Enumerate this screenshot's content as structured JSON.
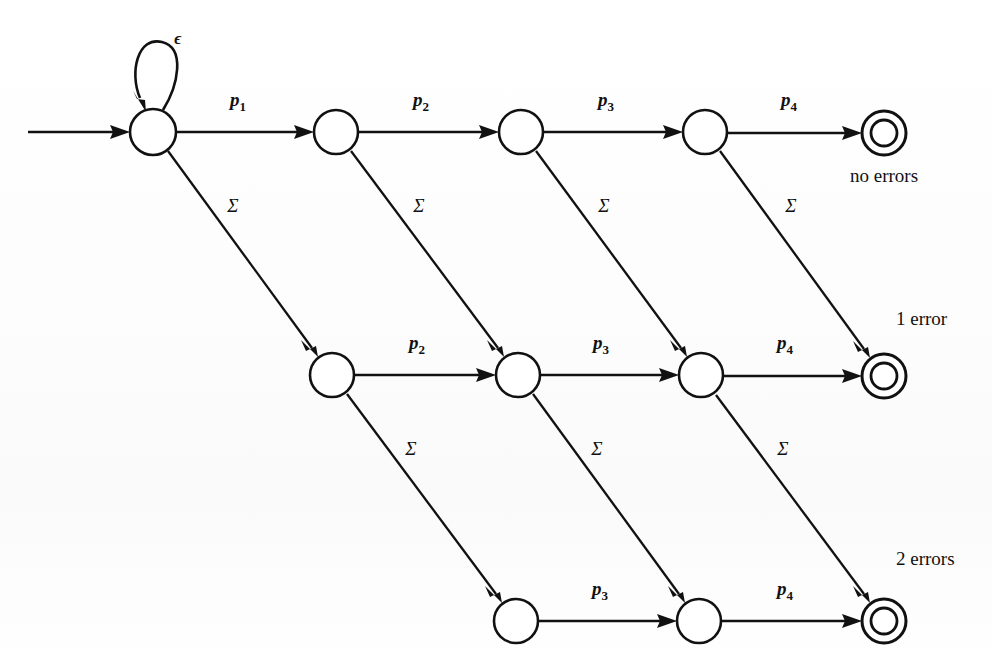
{
  "diagram": {
    "type": "state-transition-diagram",
    "background_color": "#fefefe",
    "stroke_color": "#111111",
    "start_arrow": {
      "label": "",
      "from_x": 28,
      "to_x": 126,
      "y": 132
    },
    "self_loop": {
      "label": "ϵ",
      "on_state": "r0c0",
      "label_x": 178,
      "label_y": 44
    },
    "rows": [
      {
        "id": "row-0",
        "error_count": 0,
        "caption": "no errors",
        "caption_x": 884,
        "caption_y": 182,
        "caption_position": "below",
        "y": 132,
        "states": [
          {
            "id": "r0c0",
            "cx": 153,
            "cy": 132,
            "r": 23,
            "kind": "start",
            "accepting": false
          },
          {
            "id": "r0c1",
            "cx": 336,
            "cy": 132,
            "r": 22,
            "kind": "normal",
            "accepting": false
          },
          {
            "id": "r0c2",
            "cx": 521,
            "cy": 132,
            "r": 22,
            "kind": "normal",
            "accepting": false
          },
          {
            "id": "r0c3",
            "cx": 705,
            "cy": 132,
            "r": 22,
            "kind": "normal",
            "accepting": false
          },
          {
            "id": "r0c4",
            "cx": 884,
            "cy": 133,
            "r": 22,
            "kind": "accept",
            "accepting": true
          }
        ],
        "horizontal_labels": [
          "p1",
          "p2",
          "p3",
          "p4"
        ]
      },
      {
        "id": "row-1",
        "error_count": 1,
        "caption": "1 error",
        "caption_x": 896,
        "caption_y": 325,
        "caption_position": "above-left",
        "y": 375,
        "states": [
          {
            "id": "r1c1",
            "cx": 332,
            "cy": 375,
            "r": 22,
            "kind": "normal",
            "accepting": false
          },
          {
            "id": "r1c2",
            "cx": 518,
            "cy": 375,
            "r": 22,
            "kind": "normal",
            "accepting": false
          },
          {
            "id": "r1c3",
            "cx": 701,
            "cy": 375,
            "r": 22,
            "kind": "normal",
            "accepting": false
          },
          {
            "id": "r1c4",
            "cx": 884,
            "cy": 376,
            "r": 22,
            "kind": "accept",
            "accepting": true
          }
        ],
        "horizontal_labels": [
          "p2",
          "p3",
          "p4"
        ]
      },
      {
        "id": "row-2",
        "error_count": 2,
        "caption": "2 errors",
        "caption_x": 896,
        "caption_y": 565,
        "caption_position": "above-left",
        "y": 621,
        "states": [
          {
            "id": "r2c2",
            "cx": 516,
            "cy": 621,
            "r": 22,
            "kind": "normal",
            "accepting": false
          },
          {
            "id": "r2c3",
            "cx": 699,
            "cy": 621,
            "r": 22,
            "kind": "normal",
            "accepting": false
          },
          {
            "id": "r2c4",
            "cx": 884,
            "cy": 621,
            "r": 22,
            "kind": "accept",
            "accepting": true
          }
        ],
        "horizontal_labels": [
          "p3",
          "p4"
        ]
      }
    ],
    "horizontal_edges": [
      {
        "id": "e-r0c0-r0c1",
        "from": "r0c0",
        "to": "r0c1",
        "label_base": "p",
        "label_sub": "1",
        "label_x": 238,
        "label_y": 106
      },
      {
        "id": "e-r0c1-r0c2",
        "from": "r0c1",
        "to": "r0c2",
        "label_base": "p",
        "label_sub": "2",
        "label_x": 421,
        "label_y": 106
      },
      {
        "id": "e-r0c2-r0c3",
        "from": "r0c2",
        "to": "r0c3",
        "label_base": "p",
        "label_sub": "3",
        "label_x": 606,
        "label_y": 106
      },
      {
        "id": "e-r0c3-r0c4",
        "from": "r0c3",
        "to": "r0c4",
        "label_base": "p",
        "label_sub": "4",
        "label_x": 789,
        "label_y": 106
      },
      {
        "id": "e-r1c1-r1c2",
        "from": "r1c1",
        "to": "r1c2",
        "label_base": "p",
        "label_sub": "2",
        "label_x": 417,
        "label_y": 349
      },
      {
        "id": "e-r1c2-r1c3",
        "from": "r1c2",
        "to": "r1c3",
        "label_base": "p",
        "label_sub": "3",
        "label_x": 601,
        "label_y": 349
      },
      {
        "id": "e-r1c3-r1c4",
        "from": "r1c3",
        "to": "r1c4",
        "label_base": "p",
        "label_sub": "4",
        "label_x": 785,
        "label_y": 349
      },
      {
        "id": "e-r2c2-r2c3",
        "from": "r2c2",
        "to": "r2c3",
        "label_base": "p",
        "label_sub": "3",
        "label_x": 600,
        "label_y": 595
      },
      {
        "id": "e-r2c3-r2c4",
        "from": "r2c3",
        "to": "r2c4",
        "label_base": "p",
        "label_sub": "4",
        "label_x": 785,
        "label_y": 595
      }
    ],
    "diagonal_edges": [
      {
        "id": "d-r0c0-r1c1",
        "from": "r0c0",
        "to": "r1c1",
        "label": "Σ",
        "label_x": 233,
        "label_y": 212
      },
      {
        "id": "d-r0c1-r1c2",
        "from": "r0c1",
        "to": "r1c2",
        "label": "Σ",
        "label_x": 419,
        "label_y": 212
      },
      {
        "id": "d-r0c2-r1c3",
        "from": "r0c2",
        "to": "r1c3",
        "label": "Σ",
        "label_x": 604,
        "label_y": 212
      },
      {
        "id": "d-r0c3-r1c4",
        "from": "r0c3",
        "to": "r1c4",
        "label": "Σ",
        "label_x": 791,
        "label_y": 212
      },
      {
        "id": "d-r1c1-r2c2",
        "from": "r1c1",
        "to": "r2c2",
        "label": "Σ",
        "label_x": 411,
        "label_y": 455
      },
      {
        "id": "d-r1c2-r2c3",
        "from": "r1c2",
        "to": "r2c3",
        "label": "Σ",
        "label_x": 597,
        "label_y": 455
      },
      {
        "id": "d-r1c3-r2c4",
        "from": "r1c3",
        "to": "r2c4",
        "label": "Σ",
        "label_x": 783,
        "label_y": 455
      }
    ],
    "alphabet_symbol": "Σ",
    "epsilon_symbol": "ϵ"
  }
}
